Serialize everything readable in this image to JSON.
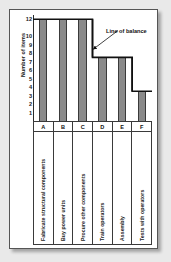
{
  "figure": {
    "background_color": "#e9e9e9",
    "panel_color": "#ffffff",
    "bar_color": "#8a8a8a",
    "line_color": "#111111"
  },
  "annotation": {
    "text": "Line of balance"
  },
  "chart_data": {
    "type": "bar",
    "title": "",
    "xlabel": "",
    "ylabel": "Number of items",
    "ylim": [
      0,
      12.5
    ],
    "grid": false,
    "legend": null,
    "categories": [
      "A",
      "B",
      "C",
      "D",
      "E",
      "F"
    ],
    "category_labels": [
      "Fabricate structural components",
      "Buy power units",
      "Procure other components",
      "Train operators",
      "Assembly",
      "Tests with operators"
    ],
    "values": [
      12,
      12,
      12,
      7.5,
      7.5,
      3.5
    ],
    "ytick_labels": [
      "12",
      "10",
      "9",
      "8",
      "7",
      "6",
      "5",
      "4",
      "3",
      "2",
      "1"
    ],
    "ytick_values": [
      12,
      10,
      9,
      8,
      7,
      6,
      5,
      4,
      3,
      2,
      1
    ],
    "annotations": [
      {
        "text": "Line of balance",
        "target_category": "C",
        "target_value": 8
      }
    ],
    "series": [
      {
        "name": "Line of balance",
        "type": "step",
        "values": [
          12,
          12,
          12,
          7.5,
          7.5,
          3.5
        ]
      }
    ]
  }
}
